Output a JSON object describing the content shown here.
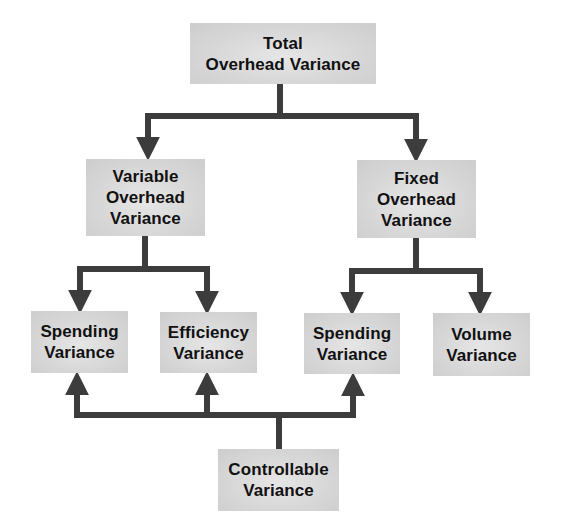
{
  "diagram": {
    "type": "hierarchy",
    "colors": {
      "node_fill": "#d6d6d6",
      "connector": "#3c3c3c",
      "text": "#111111",
      "background": "#ffffff"
    },
    "nodes": {
      "total": {
        "id": "total",
        "label": "Total\nOverhead Variance"
      },
      "variable": {
        "id": "variable",
        "label": "Variable\nOverhead\nVariance"
      },
      "fixed": {
        "id": "fixed",
        "label": "Fixed\nOverhead\nVariance"
      },
      "var_spending": {
        "id": "var_spending",
        "label": "Spending\nVariance"
      },
      "efficiency": {
        "id": "efficiency",
        "label": "Efficiency\nVariance"
      },
      "fix_spending": {
        "id": "fix_spending",
        "label": "Spending\nVariance"
      },
      "volume": {
        "id": "volume",
        "label": "Volume\nVariance"
      },
      "controllable": {
        "id": "controllable",
        "label": "Controllable\nVariance"
      }
    },
    "edges": [
      {
        "from": "total",
        "to": "variable",
        "direction": "down"
      },
      {
        "from": "total",
        "to": "fixed",
        "direction": "down"
      },
      {
        "from": "variable",
        "to": "var_spending",
        "direction": "down"
      },
      {
        "from": "variable",
        "to": "efficiency",
        "direction": "down"
      },
      {
        "from": "fixed",
        "to": "fix_spending",
        "direction": "down"
      },
      {
        "from": "fixed",
        "to": "volume",
        "direction": "down"
      },
      {
        "from": "controllable",
        "to": "var_spending",
        "direction": "up"
      },
      {
        "from": "controllable",
        "to": "efficiency",
        "direction": "up"
      },
      {
        "from": "controllable",
        "to": "fix_spending",
        "direction": "up"
      }
    ]
  }
}
